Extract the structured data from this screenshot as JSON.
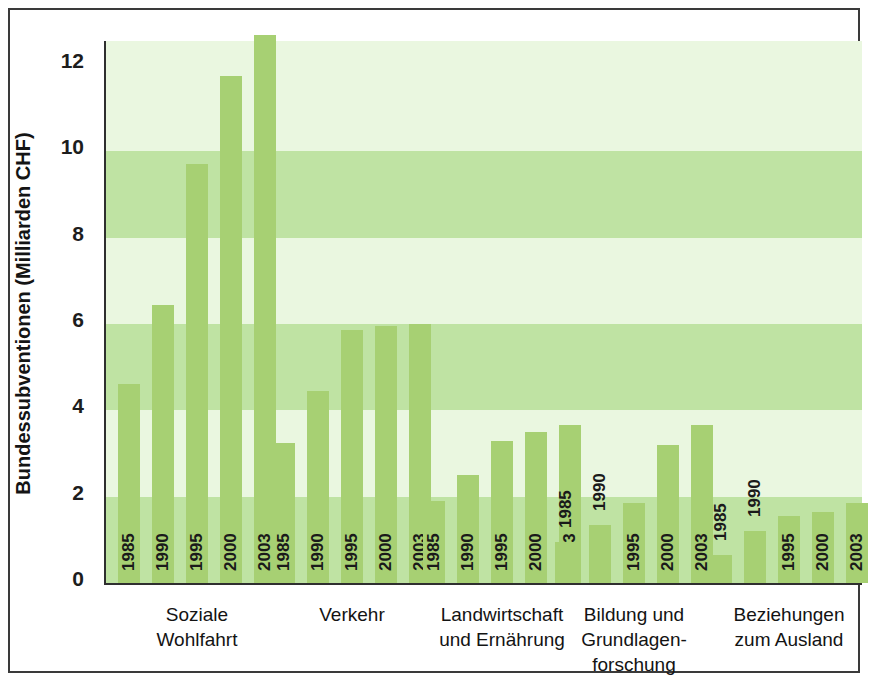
{
  "chart_data": {
    "type": "bar",
    "title": "",
    "xlabel": "",
    "ylabel": "Bundessubventionen (Milliarden CHF)",
    "ylim": [
      0,
      13
    ],
    "yticks": [
      0,
      2,
      4,
      6,
      8,
      10,
      12
    ],
    "ytick_labels": [
      "0",
      "2",
      "4",
      "6",
      "8",
      "10",
      "12"
    ],
    "grid": false,
    "banded_background": true,
    "legend": "none",
    "categories": [
      "1985",
      "1990",
      "1995",
      "2000",
      "2003"
    ],
    "groups": [
      {
        "label_lines": [
          "Soziale",
          "Wohlfahrt"
        ],
        "values": [
          4.6,
          6.45,
          9.7,
          11.75,
          12.7
        ],
        "labels_inside": [
          true,
          true,
          true,
          true,
          true
        ]
      },
      {
        "label_lines": [
          "Verkehr"
        ],
        "values": [
          3.25,
          4.45,
          5.85,
          5.95,
          6.0
        ],
        "labels_inside": [
          true,
          true,
          true,
          true,
          true
        ]
      },
      {
        "label_lines": [
          "Landwirtschaft",
          "und Ernährung"
        ],
        "values": [
          1.9,
          2.5,
          3.3,
          3.5,
          3.65
        ],
        "labels_inside": [
          true,
          true,
          true,
          true,
          true
        ]
      },
      {
        "label_lines": [
          "Bildung und",
          "Grundlagen-",
          "forschung"
        ],
        "values": [
          0.95,
          1.35,
          1.85,
          3.2,
          3.65
        ],
        "labels_inside": [
          false,
          false,
          true,
          true,
          true
        ]
      },
      {
        "label_lines": [
          "Beziehungen",
          "zum Ausland"
        ],
        "values": [
          0.65,
          1.2,
          1.55,
          1.65,
          1.85
        ],
        "labels_inside": [
          false,
          false,
          true,
          true,
          true
        ]
      }
    ],
    "colors": {
      "bar": "#a7d073",
      "band_dark": "#bfe3a3",
      "band_light": "#eaf7e0",
      "axis": "#2f2f2f",
      "text": "#141414",
      "background": "#ffffff"
    }
  }
}
